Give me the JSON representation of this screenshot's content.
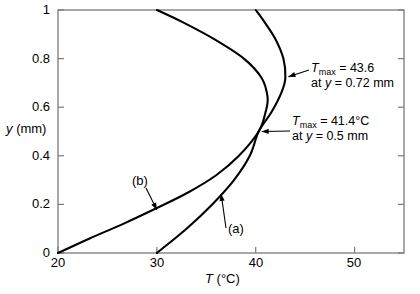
{
  "chart_data": {
    "type": "line",
    "title": "",
    "xlabel": "T (°C)",
    "ylabel": "y (mm)",
    "xlim": [
      20,
      55
    ],
    "ylim": [
      0,
      1
    ],
    "xticks": [
      20,
      30,
      40,
      50
    ],
    "yticks": [
      0,
      0.2,
      0.4,
      0.6,
      0.8,
      1
    ],
    "xticklabels": [
      "20",
      "30",
      "40",
      "50"
    ],
    "yticklabels": [
      "0",
      "0.2",
      "0.4",
      "0.6",
      "0.8",
      "1"
    ],
    "grid": false,
    "legend": "none",
    "series": [
      {
        "name": "(a)",
        "label": "(a)",
        "points": [
          {
            "T": 30.0,
            "y": 0.0
          },
          {
            "T": 33.0,
            "y": 0.1
          },
          {
            "T": 35.6,
            "y": 0.2
          },
          {
            "T": 37.8,
            "y": 0.3
          },
          {
            "T": 39.4,
            "y": 0.4
          },
          {
            "T": 40.3,
            "y": 0.5
          },
          {
            "T": 41.6,
            "y": 0.58
          },
          {
            "T": 42.6,
            "y": 0.66
          },
          {
            "T": 43.0,
            "y": 0.72
          },
          {
            "T": 42.8,
            "y": 0.8
          },
          {
            "T": 42.0,
            "y": 0.88
          },
          {
            "T": 40.9,
            "y": 0.95
          },
          {
            "T": 40.0,
            "y": 1.0
          }
        ]
      },
      {
        "name": "(b)",
        "label": "(b)",
        "points": [
          {
            "T": 20.0,
            "y": 0.0
          },
          {
            "T": 23.2,
            "y": 0.06
          },
          {
            "T": 26.6,
            "y": 0.12
          },
          {
            "T": 30.0,
            "y": 0.185
          },
          {
            "T": 33.2,
            "y": 0.25
          },
          {
            "T": 36.0,
            "y": 0.32
          },
          {
            "T": 38.3,
            "y": 0.4
          },
          {
            "T": 40.3,
            "y": 0.5
          },
          {
            "T": 41.0,
            "y": 0.58
          },
          {
            "T": 41.2,
            "y": 0.64
          },
          {
            "T": 40.6,
            "y": 0.72
          },
          {
            "T": 38.8,
            "y": 0.8
          },
          {
            "T": 35.8,
            "y": 0.88
          },
          {
            "T": 32.6,
            "y": 0.95
          },
          {
            "T": 30.0,
            "y": 1.0
          }
        ]
      }
    ],
    "annotations": [
      {
        "id": "tmax-a",
        "line1_prefix": "T",
        "line1_sub": "max",
        "line1_rest": " = 43.6",
        "line2_pre": "at ",
        "line2_var": "y",
        "line2_rest": " = 0.72 mm",
        "target": {
          "T": 42.9,
          "y": 0.725
        }
      },
      {
        "id": "tmax-b",
        "line1_prefix": "T",
        "line1_sub": "max",
        "line1_rest": " = 41.4°C",
        "line2_pre": "at ",
        "line2_var": "y",
        "line2_rest": " = 0.5 mm",
        "target": {
          "T": 40.3,
          "y": 0.5
        }
      }
    ],
    "curve_callouts": [
      {
        "label": "(b)",
        "target": {
          "T": 30.2,
          "y": 0.19
        }
      },
      {
        "label": "(a)",
        "target": {
          "T": 36.3,
          "y": 0.235
        }
      }
    ]
  },
  "axis": {
    "y_label_var": "y",
    "y_label_unit": "(mm)",
    "x_label_var": "T",
    "x_label_unit": "(°C)"
  },
  "style": {
    "curve_color": "#000000",
    "frame_color": "#7a7a7a",
    "background": "#ffffff"
  }
}
